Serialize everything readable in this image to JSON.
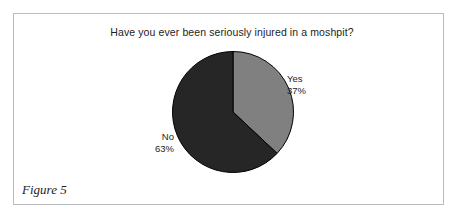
{
  "figure": {
    "caption": "Figure 5",
    "frame_color": "#b9bcc0",
    "background": "#ffffff"
  },
  "chart_data": {
    "type": "pie",
    "title": "Have you ever been seriously injured in a moshpit?",
    "categories": [
      "Yes",
      "No"
    ],
    "values": [
      37,
      63
    ],
    "unit": "%",
    "labels": [
      {
        "name": "Yes",
        "value": 37,
        "value_text": "37%",
        "color": "#808080"
      },
      {
        "name": "No",
        "value": 63,
        "value_text": "63%",
        "color": "#262626"
      }
    ],
    "start_angle_deg": 0,
    "direction": "clockwise",
    "legend": "none",
    "grid": false,
    "outline_color": "#000000",
    "xlabel": "",
    "ylabel": ""
  }
}
